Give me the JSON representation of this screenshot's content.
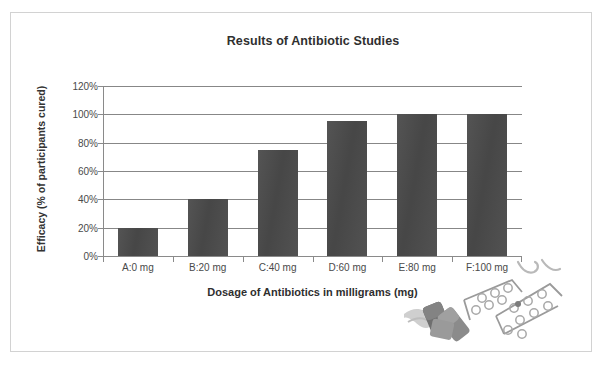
{
  "chart_data": {
    "type": "bar",
    "title": "Results of Antibiotic Studies",
    "xlabel": "Dosage of Antibiotics in milligrams (mg)",
    "ylabel": "Efficacy (% of participants cured)",
    "categories": [
      "A:0 mg",
      "B:20 mg",
      "C:40 mg",
      "D:60 mg",
      "E:80 mg",
      "F:100 mg"
    ],
    "values": [
      20,
      40,
      75,
      95,
      100,
      100
    ],
    "value_labels": [
      "20%",
      "40%",
      "75%",
      "95%",
      "100%",
      "100%"
    ],
    "ylim": [
      0,
      120
    ],
    "ytick_values": [
      0,
      20,
      40,
      60,
      80,
      100,
      120
    ],
    "ytick_labels": [
      "0%",
      "20%",
      "40%",
      "60%",
      "80%",
      "100%",
      "120%"
    ],
    "grid": true,
    "grid_axis": "y",
    "legend": false,
    "legend_position": "none",
    "series": [
      {
        "name": "Efficacy",
        "values": [
          20,
          40,
          75,
          95,
          100,
          100
        ],
        "color": "#4b4b4b"
      }
    ]
  },
  "colors": {
    "bar": "#4b4b4b",
    "gridline": "#878787",
    "axis": "#8a8a8a",
    "title_text": "#2f2f2f",
    "tick_text": "#4a4a4a",
    "frame_border": "#d2d2d2",
    "page_background": "#ffffff",
    "decor_gray": "#9a9a9a"
  },
  "decoration": {
    "name": "pill-blister-pack-illustration",
    "description": "Blister packs of pills and capsules"
  }
}
